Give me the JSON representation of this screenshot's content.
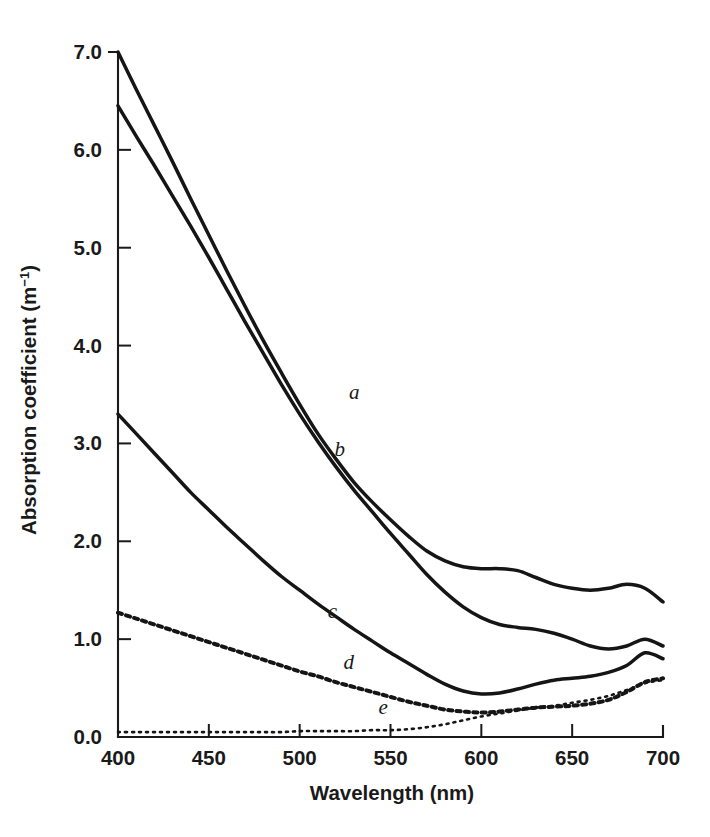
{
  "figure": {
    "background_color": "#ffffff",
    "ink_color": "#151515"
  },
  "chart_data": {
    "type": "line",
    "title": "",
    "subtitle": "",
    "xlabel": "Wavelength (nm)",
    "ylabel": "Absorption coefficient (m⁻¹)",
    "ylabel_text": "Absorption coefficient (m",
    "ylabel_sup": "−1",
    "ylabel_tail": ")",
    "xlim": [
      400,
      700
    ],
    "ylim": [
      0.0,
      7.0
    ],
    "grid": false,
    "legend": "inline-curve-labels",
    "xticks": [
      400,
      450,
      500,
      550,
      600,
      650,
      700
    ],
    "xtick_labels": [
      "400",
      "450",
      "500",
      "550",
      "600",
      "650",
      "700"
    ],
    "yticks": [
      0.0,
      1.0,
      2.0,
      3.0,
      4.0,
      5.0,
      6.0,
      7.0
    ],
    "ytick_labels": [
      "0.0",
      "1.0",
      "2.0",
      "3.0",
      "4.0",
      "5.0",
      "6.0",
      "7.0"
    ],
    "x": [
      400,
      410,
      420,
      430,
      440,
      450,
      460,
      470,
      480,
      490,
      500,
      510,
      520,
      530,
      540,
      550,
      560,
      570,
      580,
      590,
      600,
      610,
      620,
      630,
      640,
      650,
      660,
      670,
      680,
      690,
      700
    ],
    "series": [
      {
        "name": "a",
        "label": "a",
        "style": "solid",
        "label_x": 530,
        "label_y": 3.45,
        "values": [
          7.0,
          6.62,
          6.25,
          5.88,
          5.5,
          5.13,
          4.76,
          4.4,
          4.05,
          3.72,
          3.4,
          3.1,
          2.84,
          2.6,
          2.4,
          2.22,
          2.05,
          1.9,
          1.8,
          1.74,
          1.72,
          1.72,
          1.7,
          1.63,
          1.56,
          1.52,
          1.5,
          1.52,
          1.56,
          1.52,
          1.38
        ]
      },
      {
        "name": "b",
        "label": "b",
        "style": "solid",
        "label_x": 522,
        "label_y": 2.87,
        "values": [
          6.45,
          6.14,
          5.84,
          5.53,
          5.22,
          4.9,
          4.57,
          4.24,
          3.92,
          3.6,
          3.3,
          3.02,
          2.76,
          2.52,
          2.3,
          2.08,
          1.87,
          1.66,
          1.48,
          1.33,
          1.22,
          1.15,
          1.12,
          1.1,
          1.06,
          1.0,
          0.93,
          0.9,
          0.93,
          1.0,
          0.93
        ]
      },
      {
        "name": "c",
        "label": "c",
        "style": "solid",
        "label_x": 518,
        "label_y": 1.22,
        "values": [
          3.3,
          3.1,
          2.9,
          2.7,
          2.5,
          2.32,
          2.14,
          1.97,
          1.8,
          1.64,
          1.5,
          1.36,
          1.23,
          1.1,
          0.98,
          0.86,
          0.75,
          0.64,
          0.54,
          0.47,
          0.44,
          0.45,
          0.49,
          0.54,
          0.58,
          0.6,
          0.62,
          0.66,
          0.73,
          0.86,
          0.8
        ]
      },
      {
        "name": "d",
        "label": "d",
        "style": "dashed",
        "label_x": 527,
        "label_y": 0.7,
        "values": [
          1.27,
          1.21,
          1.15,
          1.09,
          1.03,
          0.97,
          0.91,
          0.85,
          0.79,
          0.73,
          0.67,
          0.62,
          0.56,
          0.51,
          0.46,
          0.41,
          0.36,
          0.32,
          0.28,
          0.26,
          0.25,
          0.26,
          0.28,
          0.3,
          0.31,
          0.32,
          0.34,
          0.38,
          0.46,
          0.56,
          0.6
        ]
      },
      {
        "name": "e",
        "label": "e",
        "style": "dotted",
        "label_x": 546,
        "label_y": 0.24,
        "values": [
          0.05,
          0.05,
          0.05,
          0.05,
          0.05,
          0.05,
          0.05,
          0.05,
          0.05,
          0.05,
          0.06,
          0.06,
          0.06,
          0.06,
          0.07,
          0.07,
          0.08,
          0.1,
          0.13,
          0.17,
          0.21,
          0.24,
          0.27,
          0.3,
          0.32,
          0.35,
          0.38,
          0.42,
          0.48,
          0.55,
          0.58
        ]
      }
    ]
  }
}
